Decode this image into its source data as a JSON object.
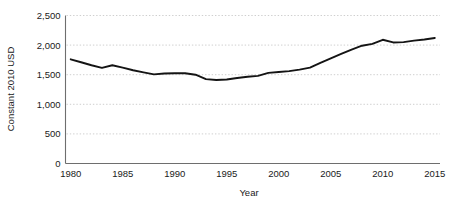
{
  "chart_data": {
    "type": "line",
    "title": "",
    "xlabel": "Year",
    "ylabel": "Constant 2010 USD",
    "xlim": [
      1979.5,
      2015.5
    ],
    "ylim": [
      0,
      2500
    ],
    "grid": true,
    "legend": false,
    "legend_position": "none",
    "line_color": "#141414",
    "grid_color": "#c9c9c9",
    "axis_color": "#6e6e6e",
    "x_ticks": [
      1980,
      1985,
      1990,
      1995,
      2000,
      2005,
      2010,
      2015
    ],
    "x_tick_labels": [
      "1980",
      "1985",
      "1990",
      "1995",
      "2000",
      "2005",
      "2010",
      "2015"
    ],
    "y_ticks": [
      0,
      500,
      1000,
      1500,
      2000,
      2500
    ],
    "y_tick_labels": [
      "0",
      "500",
      "1,000",
      "1,500",
      "2,000",
      "2,500"
    ],
    "x": [
      1980,
      1981,
      1982,
      1983,
      1984,
      1985,
      1986,
      1987,
      1988,
      1989,
      1990,
      1991,
      1992,
      1993,
      1994,
      1995,
      1996,
      1997,
      1998,
      1999,
      2000,
      2001,
      2002,
      2003,
      2004,
      2005,
      2006,
      2007,
      2008,
      2009,
      2010,
      2011,
      2012,
      2013,
      2014,
      2015
    ],
    "series": [
      {
        "name": "Constant 2010 USD",
        "values": [
          1760,
          1710,
          1660,
          1615,
          1660,
          1620,
          1575,
          1540,
          1505,
          1520,
          1525,
          1525,
          1500,
          1425,
          1410,
          1420,
          1445,
          1465,
          1480,
          1530,
          1545,
          1560,
          1585,
          1620,
          1700,
          1775,
          1850,
          1925,
          1990,
          2020,
          2090,
          2045,
          2050,
          2075,
          2095,
          2120
        ]
      }
    ]
  }
}
